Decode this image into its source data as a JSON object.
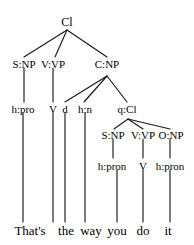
{
  "figure": {
    "kind": "constituency-syntax-tree",
    "sentence": "That's the way you do it",
    "line_color": "#1a1a1a",
    "text_color": "#000000",
    "background_color": "#ffffff"
  },
  "nodes": {
    "root": {
      "label": "Cl",
      "x": 67,
      "y": 22
    },
    "level2": [
      {
        "id": "subject-np",
        "label": "S:NP",
        "x": 24,
        "y": 65
      },
      {
        "id": "verb-vp",
        "label": "V:VP",
        "x": 53,
        "y": 65
      },
      {
        "id": "complement-np",
        "label": "C:NP",
        "x": 107,
        "y": 65
      }
    ],
    "level3": [
      {
        "id": "head-pro",
        "label": "h:pro",
        "x": 23,
        "y": 110
      },
      {
        "id": "verb",
        "label": "V",
        "x": 53,
        "y": 110
      },
      {
        "id": "determiner",
        "label": "d",
        "x": 65,
        "y": 110
      },
      {
        "id": "head-n",
        "label": "h:n",
        "x": 85,
        "y": 110
      },
      {
        "id": "qualifier-cl",
        "label": "q:Cl",
        "x": 127,
        "y": 110
      }
    ],
    "level4": [
      {
        "id": "inner-subject-np",
        "label": "S:NP",
        "x": 113,
        "y": 136
      },
      {
        "id": "inner-verb-vp",
        "label": "V:VP",
        "x": 143,
        "y": 136
      },
      {
        "id": "object-np",
        "label": "O:NP",
        "x": 171,
        "y": 136
      }
    ],
    "level5": [
      {
        "id": "inner-head-pron",
        "label": "h:pron",
        "x": 112,
        "y": 167
      },
      {
        "id": "inner-verb",
        "label": "V",
        "x": 143,
        "y": 167
      },
      {
        "id": "object-head-pron",
        "label": "h:pron",
        "x": 170,
        "y": 167
      }
    ]
  },
  "leaves": [
    {
      "id": "word-thats",
      "text": "That's",
      "x": 30,
      "y": 232
    },
    {
      "id": "word-the",
      "text": "the",
      "x": 66,
      "y": 232
    },
    {
      "id": "word-way",
      "text": "way",
      "x": 91,
      "y": 232
    },
    {
      "id": "word-you",
      "text": "you",
      "x": 117,
      "y": 232
    },
    {
      "id": "word-do",
      "text": "do",
      "x": 143,
      "y": 232
    },
    {
      "id": "word-it",
      "text": "it",
      "x": 168,
      "y": 232
    }
  ],
  "edges": {
    "branches": [
      {
        "from": "root",
        "to": "subject-np",
        "x1": 67,
        "y1": 30,
        "x2": 24,
        "y2": 57
      },
      {
        "from": "root",
        "to": "verb-vp",
        "x1": 67,
        "y1": 30,
        "x2": 55,
        "y2": 57
      },
      {
        "from": "root",
        "to": "complement-np",
        "x1": 67,
        "y1": 30,
        "x2": 107,
        "y2": 57
      },
      {
        "from": "complement-np",
        "to": "determiner",
        "x1": 107,
        "y1": 76,
        "x2": 65,
        "y2": 102
      },
      {
        "from": "complement-np",
        "to": "head-n",
        "x1": 107,
        "y1": 76,
        "x2": 84,
        "y2": 102
      },
      {
        "from": "complement-np",
        "to": "qualifier-cl",
        "x1": 107,
        "y1": 76,
        "x2": 127,
        "y2": 102
      },
      {
        "from": "qualifier-cl",
        "to": "inner-subject-np",
        "x1": 128,
        "y1": 119,
        "x2": 114,
        "y2": 129
      },
      {
        "from": "qualifier-cl",
        "to": "inner-verb-vp",
        "x1": 128,
        "y1": 119,
        "x2": 143,
        "y2": 129
      },
      {
        "from": "qualifier-cl",
        "to": "object-np",
        "x1": 128,
        "y1": 119,
        "x2": 170,
        "y2": 129
      }
    ],
    "verticals": [
      {
        "id": "stem-subject-np",
        "x": 24,
        "y1": 68,
        "y2": 102
      },
      {
        "id": "stem-verb-vp",
        "x": 53,
        "y1": 68,
        "y2": 102
      },
      {
        "id": "stem-head-pro",
        "x": 23,
        "y1": 113,
        "y2": 222
      },
      {
        "id": "stem-verb",
        "x": 53,
        "y1": 113,
        "y2": 222
      },
      {
        "id": "stem-determiner",
        "x": 65,
        "y1": 113,
        "y2": 222
      },
      {
        "id": "stem-head-n",
        "x": 85,
        "y1": 113,
        "y2": 222
      },
      {
        "id": "stem-inner-subject-np",
        "x": 113,
        "y1": 139,
        "y2": 158
      },
      {
        "id": "stem-inner-verb-vp",
        "x": 143,
        "y1": 139,
        "y2": 158
      },
      {
        "id": "stem-object-np",
        "x": 170,
        "y1": 139,
        "y2": 158
      },
      {
        "id": "stem-inner-head-pron",
        "x": 117,
        "y1": 170,
        "y2": 222
      },
      {
        "id": "stem-inner-verb",
        "x": 143,
        "y1": 170,
        "y2": 222
      },
      {
        "id": "stem-object-head-pron",
        "x": 170,
        "y1": 170,
        "y2": 222
      }
    ]
  }
}
